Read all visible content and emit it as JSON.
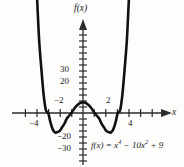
{
  "figure": {
    "background_color": "#fdfdfb",
    "curve_color": "#111111",
    "axis_color": "#2b2b2b"
  },
  "chart_data": {
    "type": "line",
    "title": "",
    "subtitle": "",
    "xlabel": "x",
    "ylabel": "f(x)",
    "equation_text": "f(x) = x",
    "equation_exp1": "4",
    "equation_mid": " − 10x",
    "equation_exp2": "2",
    "equation_tail": " + 9",
    "function": "f(x) = x^4 - 10x^2 + 9",
    "grid": false,
    "legend": "none",
    "xlim": [
      -5.5,
      5.5
    ],
    "ylim": [
      -33,
      48
    ],
    "x_tick_labels": [
      "−4",
      "−2",
      "2",
      "4"
    ],
    "x_tick_values": [
      -4,
      -2,
      2,
      4
    ],
    "y_tick_labels": [
      "30",
      "20",
      "−20",
      "−30"
    ],
    "y_tick_values": [
      30,
      20,
      -20,
      -30
    ],
    "x_minor_tick_step": 1,
    "y_minor_tick_step": 5,
    "roots": [
      -3,
      -1,
      1,
      3
    ],
    "local_maximum": {
      "x": 0,
      "y": 9
    },
    "local_minima": [
      {
        "x": -2.236,
        "y": -16
      },
      {
        "x": 2.236,
        "y": -16
      }
    ],
    "y_intercept": 9,
    "points": [
      {
        "x": -4.1,
        "y": 114.3
      },
      {
        "x": -4.0,
        "y": 105.0
      },
      {
        "x": -3.8,
        "y": 64.1
      },
      {
        "x": -3.6,
        "y": 38.3
      },
      {
        "x": -3.4,
        "y": 15.9
      },
      {
        "x": -3.2,
        "y": 2.4
      },
      {
        "x": -3.0,
        "y": 0.0
      },
      {
        "x": -2.8,
        "y": -8.1
      },
      {
        "x": -2.6,
        "y": -14.0
      },
      {
        "x": -2.4,
        "y": -16.4
      },
      {
        "x": -2.2,
        "y": -16.0
      },
      {
        "x": -2.0,
        "y": -15.0
      },
      {
        "x": -1.8,
        "y": -11.9
      },
      {
        "x": -1.6,
        "y": -9.0
      },
      {
        "x": -1.4,
        "y": -4.8
      },
      {
        "x": -1.2,
        "y": -2.3
      },
      {
        "x": -1.0,
        "y": 0.0
      },
      {
        "x": -0.8,
        "y": 3.0
      },
      {
        "x": -0.6,
        "y": 5.5
      },
      {
        "x": -0.4,
        "y": 7.4
      },
      {
        "x": -0.2,
        "y": 8.6
      },
      {
        "x": 0.0,
        "y": 9.0
      },
      {
        "x": 0.2,
        "y": 8.6
      },
      {
        "x": 0.4,
        "y": 7.4
      },
      {
        "x": 0.6,
        "y": 5.5
      },
      {
        "x": 0.8,
        "y": 3.0
      },
      {
        "x": 1.0,
        "y": 0.0
      },
      {
        "x": 1.2,
        "y": -2.3
      },
      {
        "x": 1.4,
        "y": -4.8
      },
      {
        "x": 1.6,
        "y": -9.0
      },
      {
        "x": 1.8,
        "y": -11.9
      },
      {
        "x": 2.0,
        "y": -15.0
      },
      {
        "x": 2.2,
        "y": -16.0
      },
      {
        "x": 2.4,
        "y": -16.4
      },
      {
        "x": 2.6,
        "y": -14.0
      },
      {
        "x": 2.8,
        "y": -8.1
      },
      {
        "x": 3.0,
        "y": 0.0
      },
      {
        "x": 3.2,
        "y": 2.4
      },
      {
        "x": 3.4,
        "y": 15.9
      },
      {
        "x": 3.6,
        "y": 38.3
      },
      {
        "x": 3.8,
        "y": 64.1
      },
      {
        "x": 4.0,
        "y": 105.0
      },
      {
        "x": 4.1,
        "y": 114.3
      }
    ]
  }
}
